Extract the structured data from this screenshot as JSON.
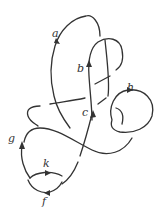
{
  "diagram": {
    "type": "knot-diagram",
    "stroke_color": "#333333",
    "background": "#ffffff",
    "arc_labels": [
      {
        "id": "a",
        "text": "a",
        "x": 52,
        "y": 37
      },
      {
        "id": "b",
        "text": "b",
        "x": 77,
        "y": 72
      },
      {
        "id": "c",
        "text": "c",
        "x": 82,
        "y": 116
      },
      {
        "id": "h",
        "text": "h",
        "x": 127,
        "y": 91
      },
      {
        "id": "g",
        "text": "g",
        "x": 8,
        "y": 142
      },
      {
        "id": "k",
        "text": "k",
        "x": 43,
        "y": 167
      },
      {
        "id": "f",
        "text": "f",
        "x": 42,
        "y": 205
      }
    ]
  }
}
